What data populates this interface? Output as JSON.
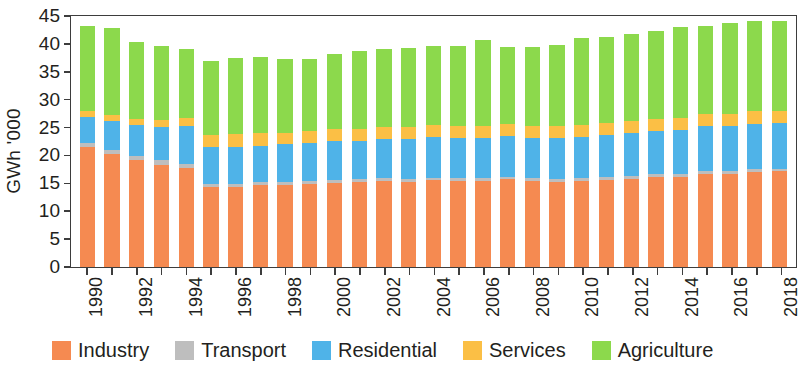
{
  "chart_data": {
    "type": "bar",
    "subtype": "stacked-bar",
    "title": "",
    "xlabel": "",
    "ylabel": "GWh '000",
    "ylim": [
      0,
      45
    ],
    "yticks": [
      0,
      5,
      10,
      15,
      20,
      25,
      30,
      35,
      40,
      45
    ],
    "grid": false,
    "legend_position": "bottom",
    "categories": [
      "1990",
      "1991",
      "1992",
      "1993",
      "1994",
      "1995",
      "1996",
      "1997",
      "1998",
      "1999",
      "2000",
      "2001",
      "2002",
      "2003",
      "2004",
      "2005",
      "2006",
      "2007",
      "2008",
      "2009",
      "2010",
      "2011",
      "2012",
      "2013",
      "2014",
      "2015",
      "2016",
      "2017",
      "2018"
    ],
    "tick_labels": [
      "1990",
      "",
      "1992",
      "",
      "1994",
      "",
      "1996",
      "",
      "1998",
      "",
      "2000",
      "",
      "2002",
      "",
      "2004",
      "",
      "2006",
      "",
      "2008",
      "",
      "2010",
      "",
      "2012",
      "",
      "2014",
      "",
      "2016",
      "",
      "2018"
    ],
    "series": [
      {
        "name": "Industry",
        "color": "#F58A51",
        "values": [
          21.3,
          20.1,
          19.0,
          18.2,
          17.6,
          14.2,
          14.2,
          14.6,
          14.6,
          14.8,
          15.0,
          15.2,
          15.3,
          15.2,
          15.4,
          15.3,
          15.3,
          15.6,
          15.3,
          15.2,
          15.3,
          15.5,
          15.7,
          16.0,
          16.0,
          16.6,
          16.5,
          16.9,
          17.0
        ]
      },
      {
        "name": "Transport",
        "color": "#BEBEBE",
        "values": [
          0.7,
          0.8,
          0.8,
          0.8,
          0.8,
          0.5,
          0.5,
          0.5,
          0.5,
          0.5,
          0.5,
          0.5,
          0.5,
          0.5,
          0.5,
          0.5,
          0.5,
          0.5,
          0.5,
          0.5,
          0.5,
          0.5,
          0.5,
          0.5,
          0.5,
          0.5,
          0.5,
          0.5,
          0.5
        ]
      },
      {
        "name": "Residential",
        "color": "#4FB3E8",
        "values": [
          4.6,
          5.0,
          5.4,
          5.9,
          6.7,
          6.6,
          6.7,
          6.5,
          6.7,
          6.8,
          6.9,
          6.8,
          7.0,
          7.1,
          7.2,
          7.2,
          7.1,
          7.2,
          7.2,
          7.3,
          7.4,
          7.5,
          7.6,
          7.7,
          7.8,
          7.9,
          8.0,
          8.1,
          8.1
        ]
      },
      {
        "name": "Services",
        "color": "#FBBF45",
        "values": [
          1.1,
          1.1,
          1.2,
          1.3,
          1.4,
          2.2,
          2.2,
          2.2,
          2.1,
          2.1,
          2.1,
          2.1,
          2.1,
          2.1,
          2.1,
          2.1,
          2.1,
          2.1,
          2.1,
          2.1,
          2.1,
          2.2,
          2.2,
          2.2,
          2.2,
          2.2,
          2.2,
          2.2,
          2.2
        ]
      },
      {
        "name": "Agriculture",
        "color": "#8CD94C",
        "values": [
          15.1,
          15.5,
          13.7,
          13.1,
          12.2,
          13.1,
          13.6,
          13.6,
          13.1,
          12.8,
          13.4,
          13.8,
          13.8,
          14.0,
          14.2,
          14.3,
          15.4,
          13.8,
          14.1,
          14.4,
          15.5,
          15.3,
          15.4,
          15.5,
          16.2,
          15.6,
          16.2,
          16.1,
          16.0
        ]
      }
    ]
  },
  "legend": {
    "items": [
      {
        "label": "Industry"
      },
      {
        "label": "Transport"
      },
      {
        "label": "Residential"
      },
      {
        "label": "Services"
      },
      {
        "label": "Agriculture"
      }
    ]
  }
}
